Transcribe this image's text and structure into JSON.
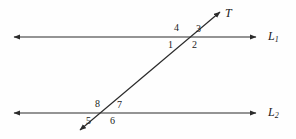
{
  "figure": {
    "width": 296,
    "height": 139,
    "background_color": "#fefefe",
    "stroke_color": "#2b2b2b",
    "label_color": "#1a1a1a"
  },
  "lines": {
    "l1": {
      "label": "L",
      "subscript": "1",
      "y": 37,
      "x_start": 12,
      "x_end": 258,
      "arrowheads": "both"
    },
    "l2": {
      "label": "L",
      "subscript": "2",
      "y": 113,
      "x_start": 12,
      "x_end": 258,
      "arrowheads": "both"
    },
    "transversal": {
      "label": "T",
      "x_start": 78,
      "y_start": 132,
      "x_end": 222,
      "y_end": 10,
      "arrowheads": "both"
    }
  },
  "intersections": {
    "upper": {
      "x": 188,
      "y": 37
    },
    "lower": {
      "x": 107,
      "y": 113
    }
  },
  "angles": [
    {
      "id": "1",
      "label": "1",
      "x": 168,
      "y": 40,
      "position": "below-left-upper"
    },
    {
      "id": "2",
      "label": "2",
      "x": 192,
      "y": 40,
      "position": "below-right-upper"
    },
    {
      "id": "3",
      "label": "3",
      "x": 196,
      "y": 24,
      "position": "above-right-upper"
    },
    {
      "id": "4",
      "label": "4",
      "x": 174,
      "y": 23,
      "position": "above-left-upper"
    },
    {
      "id": "5",
      "label": "5",
      "x": 86,
      "y": 116,
      "position": "below-left-lower"
    },
    {
      "id": "6",
      "label": "6",
      "x": 110,
      "y": 116,
      "position": "below-right-lower"
    },
    {
      "id": "7",
      "label": "7",
      "x": 117,
      "y": 100,
      "position": "above-right-lower"
    },
    {
      "id": "8",
      "label": "8",
      "x": 95,
      "y": 99,
      "position": "above-left-lower"
    }
  ]
}
